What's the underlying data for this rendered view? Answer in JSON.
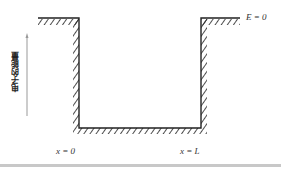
{
  "diagram": {
    "type": "infinite potential well",
    "y_axis_label": "电子的能量",
    "energy_label": "E = 0",
    "left_boundary_label": "x = 0",
    "right_boundary_label": "x = L",
    "colors": {
      "line": "#222222",
      "axis": "#999999",
      "rule": "#c8c8c8"
    }
  }
}
